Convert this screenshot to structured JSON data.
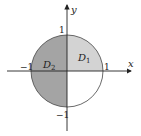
{
  "diagram": {
    "type": "region-diagram",
    "axes": {
      "x_label": "x",
      "y_label": "y",
      "ticks": {
        "x_pos": "1",
        "x_neg": "−1",
        "y_pos": "1",
        "y_neg": "−1"
      }
    },
    "regions": [
      {
        "name": "D",
        "sub": "1",
        "area": "upper-right quarter of unit disk",
        "color": "#d3d3d3"
      },
      {
        "name": "D",
        "sub": "2",
        "area": "left half of unit disk",
        "color": "#a4a4a4"
      }
    ],
    "circle": {
      "radius": 1,
      "stroke": "#333333"
    }
  }
}
